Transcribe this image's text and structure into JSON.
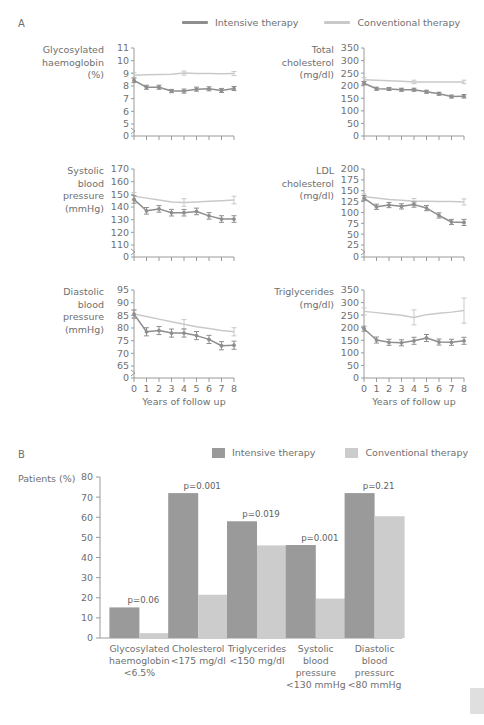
{
  "panels": {
    "a_letter": "A",
    "b_letter": "B"
  },
  "legend": {
    "intensive_label": "Intensive therapy",
    "conventional_label": "Conventional therapy",
    "intensive_color": "#8e8e8e",
    "conventional_color": "#c9c9c9"
  },
  "axis": {
    "x_caption": "Years of follow up",
    "x_ticks": [
      "0",
      "1",
      "2",
      "3",
      "4",
      "5",
      "6",
      "7",
      "8"
    ],
    "b_y_title": "Patients (%)"
  },
  "chart_data": [
    {
      "type": "line",
      "id": "glycosylated-haemoglobin",
      "title": "",
      "ylabel": "Glycosylated\nhaemoglobin\n(%)",
      "xlabel": "Years of follow up",
      "ylim": [
        0,
        11
      ],
      "yticks": [
        0,
        5,
        6,
        7,
        8,
        9,
        10,
        11
      ],
      "ytick_labels": [
        "0",
        "5",
        "6",
        "7",
        "8",
        "9",
        "10",
        "11"
      ],
      "axis_break": true,
      "x": [
        0,
        1,
        2,
        3,
        4,
        5,
        6,
        7,
        8
      ],
      "series": [
        {
          "name": "Intensive therapy",
          "values": [
            8.45,
            7.9,
            7.9,
            7.6,
            7.6,
            7.75,
            7.78,
            7.65,
            7.8
          ],
          "errors": [
            0.18,
            0.16,
            0.16,
            0.13,
            0.16,
            0.16,
            0.16,
            0.16,
            0.16
          ]
        },
        {
          "name": "Conventional therapy",
          "values": [
            8.85,
            8.88,
            8.9,
            8.93,
            9.02,
            8.99,
            8.98,
            8.97,
            8.98
          ],
          "errors": [
            0.2,
            0,
            0,
            0,
            0.16,
            0,
            0,
            0,
            0.16
          ]
        }
      ]
    },
    {
      "type": "line",
      "id": "total-cholesterol",
      "ylabel": "Total\ncholesterol\n(mg/dl)",
      "xlabel": "Years of follow up",
      "ylim": [
        0,
        350
      ],
      "yticks": [
        0,
        50,
        100,
        150,
        200,
        250,
        300,
        350
      ],
      "ytick_labels": [
        "0",
        "50",
        "100",
        "150",
        "200",
        "250",
        "300",
        "350"
      ],
      "axis_break": false,
      "x": [
        0,
        1,
        2,
        3,
        4,
        5,
        6,
        7,
        8
      ],
      "series": [
        {
          "name": "Intensive therapy",
          "values": [
            210,
            188,
            187,
            184,
            184,
            176,
            168,
            157,
            158
          ],
          "errors": [
            7,
            6,
            6,
            6,
            6,
            6,
            6,
            6,
            7
          ]
        },
        {
          "name": "Conventional therapy",
          "values": [
            224,
            222,
            220,
            218,
            215,
            215,
            215,
            215,
            215
          ],
          "errors": [
            8,
            0,
            0,
            0,
            7,
            0,
            0,
            0,
            7
          ]
        }
      ]
    },
    {
      "type": "line",
      "id": "systolic-blood-pressure",
      "ylabel": "Systolic\nblood\npressure\n(mmHg)",
      "xlabel": "Years of follow up",
      "ylim": [
        0,
        170
      ],
      "yticks": [
        0,
        110,
        120,
        130,
        140,
        150,
        160,
        170
      ],
      "ytick_labels": [
        "0",
        "110",
        "120",
        "130",
        "140",
        "150",
        "160",
        "170"
      ],
      "axis_break": true,
      "x": [
        0,
        1,
        2,
        3,
        4,
        5,
        6,
        7,
        8
      ],
      "series": [
        {
          "name": "Intensive therapy",
          "values": [
            146,
            137,
            138.5,
            135.5,
            135.5,
            136.5,
            133,
            130.5,
            130.5
          ],
          "errors": [
            3,
            2.6,
            2.6,
            2.6,
            2.6,
            2.6,
            2.6,
            2.6,
            2.6
          ]
        },
        {
          "name": "Conventional therapy",
          "values": [
            148.5,
            147,
            145.5,
            144,
            143.5,
            144,
            144.5,
            145,
            145.5
          ],
          "errors": [
            3,
            0,
            0,
            0,
            3,
            0,
            0,
            0,
            3
          ]
        }
      ]
    },
    {
      "type": "line",
      "id": "ldl-cholesterol",
      "ylabel": "LDL\ncholesterol\n(mg/dl)",
      "xlabel": "Years of follow up",
      "ylim": [
        0,
        200
      ],
      "yticks": [
        0,
        25,
        50,
        75,
        100,
        125,
        150,
        175,
        200
      ],
      "ytick_labels": [
        "0",
        "25",
        "50",
        "75",
        "100",
        "125",
        "150",
        "175",
        "200"
      ],
      "axis_break": true,
      "x": [
        0,
        1,
        2,
        3,
        4,
        5,
        6,
        7,
        8
      ],
      "series": [
        {
          "name": "Intensive therapy",
          "values": [
            133,
            113,
            117,
            114,
            118,
            110,
            93,
            78,
            77
          ],
          "errors": [
            6,
            6,
            6,
            6,
            6,
            6,
            6,
            6,
            7
          ]
        },
        {
          "name": "Conventional therapy",
          "values": [
            136,
            133,
            130,
            128,
            126,
            126,
            125,
            125,
            124
          ],
          "errors": [
            7,
            0,
            0,
            0,
            6,
            0,
            0,
            0,
            7
          ]
        }
      ]
    },
    {
      "type": "line",
      "id": "diastolic-blood-pressure",
      "ylabel": "Diastolic\nblood\npressure\n(mmHg)",
      "xlabel": "Years of follow up",
      "ylim": [
        0,
        95
      ],
      "yticks": [
        0,
        65,
        70,
        75,
        80,
        85,
        90,
        95
      ],
      "ytick_labels": [
        "0",
        "65",
        "70",
        "75",
        "80",
        "85",
        "90",
        "95"
      ],
      "axis_break": true,
      "x": [
        0,
        1,
        2,
        3,
        4,
        5,
        6,
        7,
        8
      ],
      "series": [
        {
          "name": "Intensive therapy",
          "values": [
            85.5,
            78.5,
            79,
            78,
            78,
            77,
            75.5,
            73,
            73.2
          ],
          "errors": [
            1.6,
            1.6,
            1.6,
            1.6,
            1.6,
            1.6,
            1.6,
            1.6,
            1.6
          ]
        },
        {
          "name": "Conventional therapy",
          "values": [
            85.5,
            84.5,
            83.5,
            82.5,
            81.5,
            80.5,
            79.8,
            79,
            78.5
          ],
          "errors": [
            1.6,
            0,
            0,
            0,
            1.8,
            0,
            0,
            0,
            1.6
          ]
        }
      ]
    },
    {
      "type": "line",
      "id": "triglycerides",
      "ylabel": "Triglycerides\n(mg/dl)",
      "xlabel": "Years of follow up",
      "ylim": [
        0,
        350
      ],
      "yticks": [
        0,
        50,
        100,
        150,
        200,
        250,
        300,
        350
      ],
      "ytick_labels": [
        "0",
        "50",
        "100",
        "150",
        "200",
        "250",
        "300",
        "350"
      ],
      "axis_break": false,
      "x": [
        0,
        1,
        2,
        3,
        4,
        5,
        6,
        7,
        8
      ],
      "series": [
        {
          "name": "Intensive therapy",
          "values": [
            196,
            151,
            142,
            140,
            148,
            159,
            143,
            142,
            148
          ],
          "errors": [
            10,
            12,
            12,
            12,
            14,
            14,
            12,
            12,
            14
          ]
        },
        {
          "name": "Conventional therapy",
          "values": [
            265,
            260,
            255,
            250,
            241,
            252,
            258,
            262,
            268
          ],
          "errors": [
            14,
            0,
            0,
            0,
            30,
            0,
            0,
            0,
            50
          ]
        }
      ]
    },
    {
      "type": "bar",
      "id": "patients-at-goal",
      "title": "",
      "ylabel": "Patients (%)",
      "ylim": [
        0,
        80
      ],
      "yticks": [
        0,
        10,
        20,
        30,
        40,
        50,
        60,
        70,
        80
      ],
      "ytick_labels": [
        "0",
        "10",
        "20",
        "30",
        "40",
        "50",
        "60",
        "70",
        "80"
      ],
      "categories": [
        "Glycosylated\nhaemoglobin\n<6.5%",
        "Cholesterol\n<175 mg/dl",
        "Triglycerides\n<150 mg/dl",
        "Systolic\nblood\npressure\n<130 mmHg",
        "Diastolic\nblood\npressurc\n<80 mmHg"
      ],
      "series": [
        {
          "name": "Intensive therapy",
          "values": [
            15.2,
            72.0,
            58.0,
            46.2,
            72.0
          ]
        },
        {
          "name": "Conventional therapy",
          "values": [
            2.4,
            21.5,
            46.0,
            19.6,
            60.5
          ]
        }
      ],
      "annotations": [
        "p=0.06",
        "p=0.001",
        "p=0.019",
        "p=0.001",
        "p=0.21"
      ]
    }
  ]
}
